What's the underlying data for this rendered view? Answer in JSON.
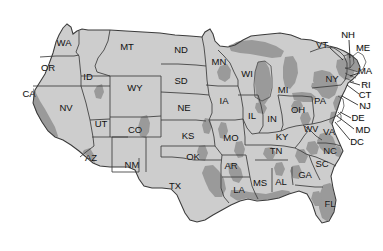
{
  "figure": {
    "type": "choropleth-outline-map",
    "background_color": "#ffffff",
    "land_fill": "#cdcdcd",
    "highlight_fill": "#9a9a9a",
    "border_color": "#3b3b3b",
    "label_color": "#111111",
    "leader_line_color": "#111111"
  },
  "states": [
    {
      "abbr": "WA",
      "x": 64,
      "y": 43,
      "placement": "inside"
    },
    {
      "abbr": "OR",
      "x": 48,
      "y": 68,
      "placement": "inside"
    },
    {
      "abbr": "CA",
      "x": 29,
      "y": 94,
      "placement": "inside"
    },
    {
      "abbr": "NV",
      "x": 66,
      "y": 108,
      "placement": "inside"
    },
    {
      "abbr": "ID",
      "x": 88,
      "y": 77,
      "placement": "inside"
    },
    {
      "abbr": "MT",
      "x": 127,
      "y": 47,
      "placement": "inside"
    },
    {
      "abbr": "WY",
      "x": 135,
      "y": 88,
      "placement": "inside"
    },
    {
      "abbr": "UT",
      "x": 101,
      "y": 124,
      "placement": "inside"
    },
    {
      "abbr": "AZ",
      "x": 91,
      "y": 158,
      "placement": "inside"
    },
    {
      "abbr": "CO",
      "x": 135,
      "y": 130,
      "placement": "inside"
    },
    {
      "abbr": "NM",
      "x": 132,
      "y": 165,
      "placement": "inside"
    },
    {
      "abbr": "ND",
      "x": 181,
      "y": 50,
      "placement": "inside"
    },
    {
      "abbr": "SD",
      "x": 181,
      "y": 81,
      "placement": "inside"
    },
    {
      "abbr": "NE",
      "x": 184,
      "y": 108,
      "placement": "inside"
    },
    {
      "abbr": "KS",
      "x": 188,
      "y": 136,
      "placement": "inside"
    },
    {
      "abbr": "OK",
      "x": 193,
      "y": 157,
      "placement": "inside"
    },
    {
      "abbr": "TX",
      "x": 175,
      "y": 186,
      "placement": "inside"
    },
    {
      "abbr": "MN",
      "x": 219,
      "y": 62,
      "placement": "inside"
    },
    {
      "abbr": "IA",
      "x": 224,
      "y": 101,
      "placement": "inside"
    },
    {
      "abbr": "MO",
      "x": 231,
      "y": 138,
      "placement": "inside"
    },
    {
      "abbr": "AR",
      "x": 231,
      "y": 166,
      "placement": "inside"
    },
    {
      "abbr": "LA",
      "x": 239,
      "y": 190,
      "placement": "inside"
    },
    {
      "abbr": "WI",
      "x": 247,
      "y": 74,
      "placement": "inside"
    },
    {
      "abbr": "IL",
      "x": 252,
      "y": 116,
      "placement": "inside"
    },
    {
      "abbr": "MS",
      "x": 260,
      "y": 183,
      "placement": "inside"
    },
    {
      "abbr": "MI",
      "x": 283,
      "y": 90,
      "placement": "inside"
    },
    {
      "abbr": "IN",
      "x": 272,
      "y": 119,
      "placement": "inside"
    },
    {
      "abbr": "KY",
      "x": 282,
      "y": 137,
      "placement": "inside"
    },
    {
      "abbr": "TN",
      "x": 276,
      "y": 151,
      "placement": "inside"
    },
    {
      "abbr": "AL",
      "x": 281,
      "y": 182,
      "placement": "inside"
    },
    {
      "abbr": "GA",
      "x": 305,
      "y": 175,
      "placement": "inside"
    },
    {
      "abbr": "OH",
      "x": 298,
      "y": 110,
      "placement": "inside"
    },
    {
      "abbr": "WV",
      "x": 311,
      "y": 129,
      "placement": "inside"
    },
    {
      "abbr": "VA",
      "x": 329,
      "y": 132,
      "placement": "inside"
    },
    {
      "abbr": "PA",
      "x": 320,
      "y": 101,
      "placement": "inside"
    },
    {
      "abbr": "NY",
      "x": 332,
      "y": 79,
      "placement": "inside"
    },
    {
      "abbr": "NC",
      "x": 330,
      "y": 151,
      "placement": "inside"
    },
    {
      "abbr": "SC",
      "x": 322,
      "y": 164,
      "placement": "inside"
    },
    {
      "abbr": "FL",
      "x": 330,
      "y": 204,
      "placement": "inside"
    }
  ],
  "callout_states": [
    {
      "abbr": "VT",
      "x": 322,
      "y": 45,
      "leader": {
        "x1": 330,
        "y1": 48,
        "x2": 343,
        "y2": 60
      }
    },
    {
      "abbr": "NH",
      "x": 348,
      "y": 35,
      "leader": {
        "x1": 349,
        "y1": 40,
        "x2": 350,
        "y2": 58
      }
    },
    {
      "abbr": "ME",
      "x": 363,
      "y": 48,
      "leader": null
    },
    {
      "abbr": "MA",
      "x": 365,
      "y": 71,
      "leader": {
        "x1": 359,
        "y1": 73,
        "x2": 350,
        "y2": 76
      }
    },
    {
      "abbr": "RI",
      "x": 366,
      "y": 85,
      "leader": {
        "x1": 360,
        "y1": 85,
        "x2": 350,
        "y2": 82
      }
    },
    {
      "abbr": "CT",
      "x": 365,
      "y": 95,
      "leader": {
        "x1": 359,
        "y1": 94,
        "x2": 347,
        "y2": 85
      }
    },
    {
      "abbr": "NJ",
      "x": 365,
      "y": 106,
      "leader": {
        "x1": 358,
        "y1": 105,
        "x2": 342,
        "y2": 96
      }
    },
    {
      "abbr": "DE",
      "x": 358,
      "y": 118,
      "leader": {
        "x1": 351,
        "y1": 118,
        "x2": 340,
        "y2": 112
      }
    },
    {
      "abbr": "MD",
      "x": 363,
      "y": 130,
      "leader": {
        "x1": 354,
        "y1": 129,
        "x2": 337,
        "y2": 116
      }
    },
    {
      "abbr": "DC",
      "x": 357,
      "y": 142,
      "leader": {
        "x1": 350,
        "y1": 140,
        "x2": 335,
        "y2": 122
      }
    }
  ]
}
